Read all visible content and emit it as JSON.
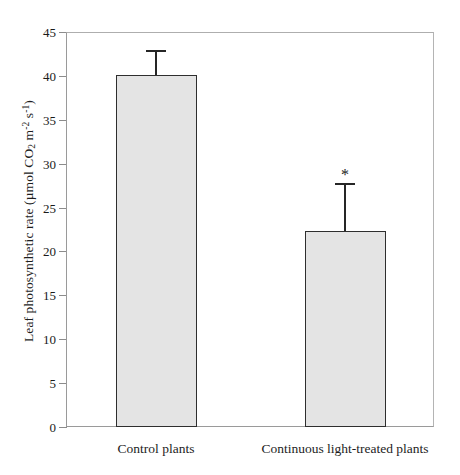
{
  "chart_data": {
    "type": "bar",
    "title": "",
    "xlabel": "",
    "ylabel": "Leaf photosynthetic rate (µmol CO₂ m⁻² s⁻¹)",
    "ylabel_parts": {
      "prefix": "Leaf photosynthetic rate (µmol CO",
      "sub_2": "2",
      "mid": " m",
      "sup_minus2": "-2",
      "space": " s",
      "sup_minus1": "-1",
      "suffix": ")"
    },
    "categories": [
      "Control plants",
      "Continuous light-treated plants"
    ],
    "values": [
      40.1,
      22.3
    ],
    "errors": [
      2.8,
      5.5
    ],
    "annotations": [
      {
        "category": "Continuous light-treated plants",
        "text": "*"
      }
    ],
    "ylim": [
      0,
      45
    ],
    "yticks": [
      0,
      5,
      10,
      15,
      20,
      25,
      30,
      35,
      40,
      45
    ],
    "ytick_labels": [
      "0",
      "5",
      "10",
      "15",
      "20",
      "25",
      "30",
      "35",
      "40",
      "45"
    ],
    "grid": false,
    "legend": null,
    "bar_fill_color": "#e4e4e4",
    "bar_edge_color": "#2e2e2e",
    "error_color": "#262626",
    "axis_color": "#9a9a9a",
    "background_color": "#ffffff"
  }
}
